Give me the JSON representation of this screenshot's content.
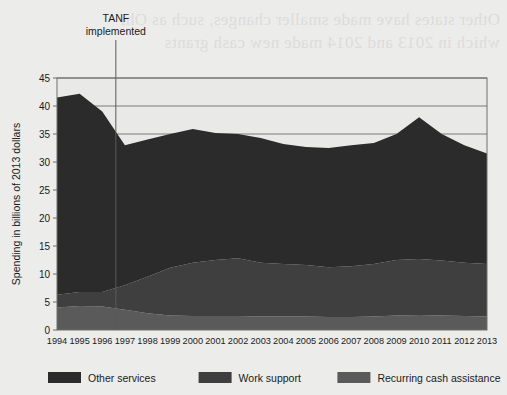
{
  "figure": {
    "background_color": "#ececeb",
    "plot_background_color": "#e9e9e7",
    "axis_color": "#6e6e6e",
    "bleed_text_line1": "Other states have made smaller changes, such as Ohio,",
    "bleed_text_line2": "which in 2013 and 2014 made new cash grants"
  },
  "annotation": {
    "line1": "TANF",
    "line2": "implemented",
    "at_year": 1996.6
  },
  "axes": {
    "ylabel": "Spending in billions of 2013 dollars",
    "yticks": [
      0,
      5,
      10,
      15,
      20,
      25,
      30,
      35,
      40,
      45
    ],
    "ylim": [
      0,
      45
    ],
    "gridlines": [
      35,
      40,
      45
    ],
    "xlabel": ""
  },
  "legend": {
    "position": "bottom",
    "items": [
      {
        "label": "Other services",
        "color": "#2b2b2b"
      },
      {
        "label": "Work support",
        "color": "#3f3f3f"
      },
      {
        "label": "Recurring cash assistance",
        "color": "#5a5a5a"
      }
    ]
  },
  "chart_data": {
    "type": "area",
    "title": "",
    "xlabel": "",
    "ylabel": "Spending in billions of 2013 dollars",
    "ylim": [
      0,
      45
    ],
    "grid": true,
    "legend_position": "bottom",
    "stacked": true,
    "stack_order_bottom_to_top": [
      "Recurring cash assistance",
      "Work support",
      "Other services"
    ],
    "categories": [
      1994,
      1995,
      1996,
      1997,
      1998,
      1999,
      2000,
      2001,
      2002,
      2003,
      2004,
      2005,
      2006,
      2007,
      2008,
      2009,
      2010,
      2011,
      2012,
      2013
    ],
    "series": [
      {
        "name": "Recurring cash assistance",
        "color": "#5a5a5a",
        "values": [
          4.0,
          4.3,
          4.2,
          3.6,
          3.0,
          2.6,
          2.5,
          2.5,
          2.5,
          2.4,
          2.4,
          2.4,
          2.3,
          2.3,
          2.4,
          2.6,
          2.7,
          2.6,
          2.5,
          2.4
        ]
      },
      {
        "name": "Work support",
        "color": "#3f3f3f",
        "values": [
          2.3,
          2.5,
          2.6,
          4.4,
          6.5,
          8.5,
          9.5,
          10.0,
          10.3,
          9.6,
          9.4,
          9.2,
          8.9,
          9.1,
          9.4,
          9.9,
          10.0,
          9.8,
          9.5,
          9.4
        ]
      },
      {
        "name": "Other services",
        "color": "#2b2b2b",
        "values": [
          35.2,
          35.4,
          32.2,
          25.0,
          24.5,
          23.9,
          23.9,
          22.7,
          22.2,
          22.3,
          21.4,
          21.1,
          21.3,
          21.6,
          21.6,
          22.5,
          25.3,
          22.6,
          21.0,
          19.7
        ]
      }
    ],
    "stacked_totals": [
      41.5,
      42.2,
      39.0,
      33.0,
      34.0,
      35.0,
      35.9,
      35.2,
      35.0,
      34.3,
      33.2,
      32.7,
      32.5,
      33.0,
      33.4,
      35.0,
      38.0,
      35.0,
      33.0,
      31.5
    ]
  }
}
